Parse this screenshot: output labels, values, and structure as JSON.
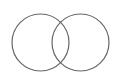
{
  "diagram": {
    "type": "venn",
    "background": "#ffffff",
    "stroke_color": "#666666",
    "stroke_width": 1.2,
    "circles": [
      {
        "name": "left-set",
        "cx": 40.5,
        "cy": 42.5,
        "r": 28.5,
        "label": ""
      },
      {
        "name": "right-set",
        "cx": 80.5,
        "cy": 42.5,
        "r": 28.5,
        "label": ""
      }
    ]
  }
}
